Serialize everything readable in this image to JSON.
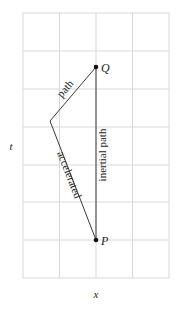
{
  "diagram": {
    "type": "spacetime-diagram",
    "axes": {
      "x_label": "x",
      "t_label": "t"
    },
    "grid": {
      "columns": 4,
      "rows": 7,
      "color": "#d6d6d6"
    },
    "points": {
      "P": {
        "label": "P"
      },
      "Q": {
        "label": "Q"
      }
    },
    "paths": {
      "inertial": {
        "label": "inertial path"
      },
      "accelerated_lower": {
        "label": "accelerated"
      },
      "accelerated_upper": {
        "label": "path"
      }
    },
    "colors": {
      "line": "#3a3a3a",
      "text": "#222222",
      "point": "#111111"
    }
  }
}
